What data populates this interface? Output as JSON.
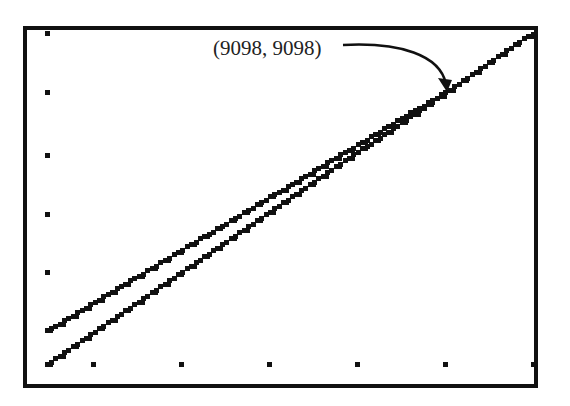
{
  "chart_data": {
    "type": "line",
    "title": "",
    "xlabel": "",
    "ylabel": "",
    "grid": false,
    "legend": null,
    "axis_ticks": {
      "x_tick_count": 7,
      "y_tick_count": 6,
      "tick_labels_visible": false
    },
    "series": [
      {
        "name": "upper-line",
        "x": [
          0,
          0.83,
          1.0
        ],
        "y": [
          0.1,
          0.83,
          1.0
        ]
      },
      {
        "name": "lower-line",
        "x": [
          0,
          0.83,
          1.0
        ],
        "y": [
          0.0,
          0.83,
          1.0
        ]
      }
    ],
    "annotations": [
      {
        "text": "(9098, 9098)",
        "points_to": "intersection",
        "x": 9098,
        "y": 9098
      }
    ],
    "style": {
      "line_color": "#111111",
      "frame_color": "#111111",
      "pixelated": true
    }
  },
  "annotation": {
    "label": "(9098, 9098)"
  }
}
